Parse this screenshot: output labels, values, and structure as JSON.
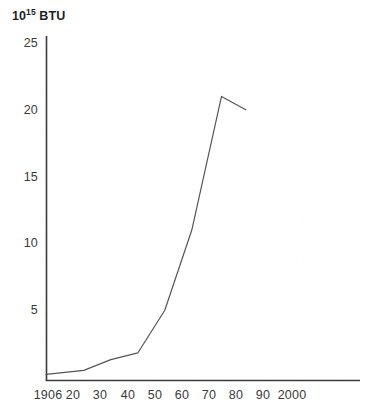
{
  "chart_data": {
    "type": "line",
    "title": "",
    "ylabel": "10^15 BTU",
    "ylabel_mantissa": "10",
    "ylabel_exponent": "15",
    "ylabel_unit": "BTU",
    "xlabel": "",
    "ylim": [
      0,
      25
    ],
    "xlim": [
      1906,
      2000
    ],
    "grid": false,
    "legend": null,
    "yticks": [
      25,
      20,
      15,
      10,
      5
    ],
    "ytick_labels": [
      "25",
      "20",
      "15",
      "10",
      "5"
    ],
    "xticks": [
      1906,
      1920,
      1930,
      1940,
      1950,
      1960,
      1970,
      1980,
      1990,
      2000
    ],
    "xtick_labels": [
      "1906",
      "20",
      "30",
      "40",
      "50",
      "60",
      "70",
      "80",
      "90",
      "2000"
    ],
    "x": [
      1906,
      1920,
      1930,
      1940,
      1950,
      1960,
      1971,
      1980
    ],
    "values": [
      0.2,
      0.5,
      1.3,
      1.8,
      5.0,
      11.0,
      21.0,
      20.0
    ],
    "series": [
      {
        "name": "Energy consumption",
        "x": [
          1906,
          1920,
          1930,
          1940,
          1950,
          1960,
          1971,
          1980
        ],
        "values": [
          0.2,
          0.5,
          1.3,
          1.8,
          5.0,
          11.0,
          21.0,
          20.0
        ],
        "color": "#555555"
      }
    ],
    "line_color": "#555555",
    "axis_color": "#3a3a3a",
    "background_color": "#ffffff"
  },
  "axes": {
    "y_unit_mantissa": "10",
    "y_unit_exponent": "15",
    "y_unit_name": "BTU"
  }
}
